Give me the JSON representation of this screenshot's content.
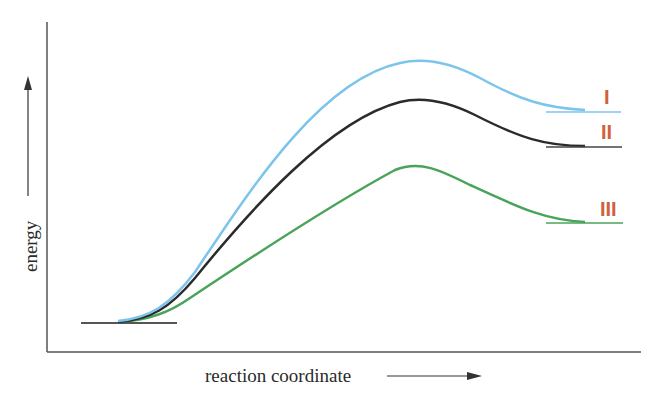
{
  "diagram": {
    "type": "reaction-energy-profile",
    "x_axis_label": "reaction coordinate",
    "y_axis_label": "energy",
    "colors": {
      "axis": "#444444",
      "curve_I": "#7cc4ec",
      "curve_II": "#2b2b2b",
      "curve_III": "#4aa35a",
      "labels": "#d0603e",
      "reactant_level": "#555555"
    },
    "curves": [
      {
        "id": "I",
        "label": "I",
        "color": "#7cc4ec",
        "relative_peak": "highest",
        "relative_product": "highest"
      },
      {
        "id": "II",
        "label": "II",
        "color": "#2b2b2b",
        "relative_peak": "middle",
        "relative_product": "middle"
      },
      {
        "id": "III",
        "label": "III",
        "color": "#4aa35a",
        "relative_peak": "lowest",
        "relative_product": "lowest"
      }
    ]
  }
}
